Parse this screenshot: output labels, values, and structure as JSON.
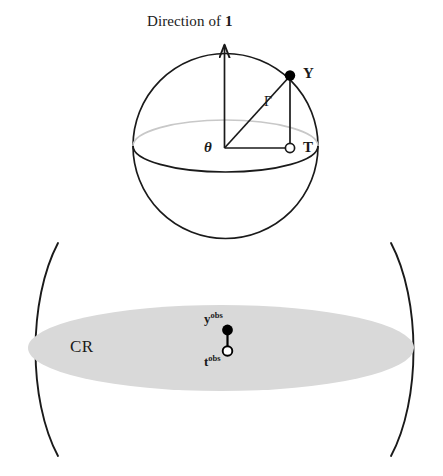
{
  "figure": {
    "title": {
      "prefix": "Direction of ",
      "vector": "1",
      "full": "Direction of 1"
    },
    "sphere": {
      "center_label": "θ",
      "surface_point_label": "Y",
      "projected_point_label": "T",
      "hypotenuse_label": "Γ"
    },
    "region": {
      "label": "CR",
      "observed_response_label": "y",
      "observed_response_sup": "obs",
      "observed_statistic_label": "t",
      "observed_statistic_sup": "obs"
    },
    "colors": {
      "stroke": "#1a1a1a",
      "hidden_edge": "#c8c8c8",
      "region_fill": "#d9d9d9",
      "background": "#ffffff",
      "filled_point": "#000000",
      "open_point_fill": "#ffffff"
    }
  }
}
